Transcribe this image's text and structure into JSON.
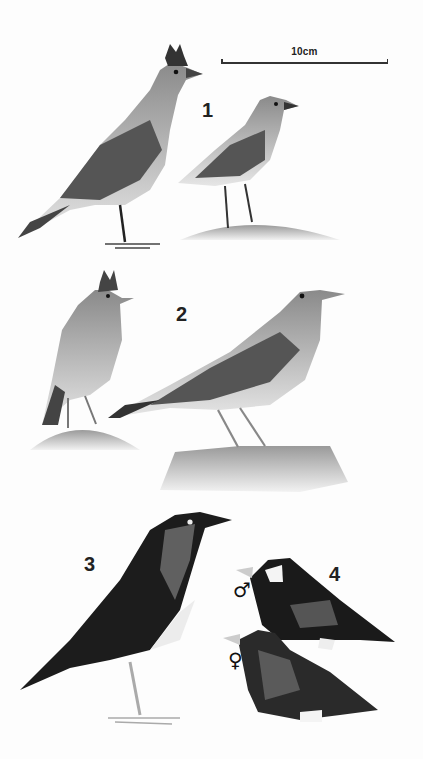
{
  "plate": {
    "scale_bar": {
      "label": "10cm"
    },
    "figures": [
      {
        "number": "1",
        "description": "crested lark-like bird, two views (one crested, one perched on mound)"
      },
      {
        "number": "2",
        "description": "streaked pipit/lark, two views on rocks"
      },
      {
        "number": "3",
        "description": "dark thrush with spotted breast"
      },
      {
        "number": "4",
        "description": "finch-like bird, male and female",
        "sexes": [
          {
            "symbol": "♂",
            "label": "male"
          },
          {
            "symbol": "♀",
            "label": "female"
          }
        ]
      }
    ],
    "colors": {
      "ink": "#222222",
      "paper": "#fdfdfd",
      "dark_plumage": "#1c1c1c",
      "mid_plumage": "#777777",
      "light_plumage": "#d9d9d9"
    }
  }
}
